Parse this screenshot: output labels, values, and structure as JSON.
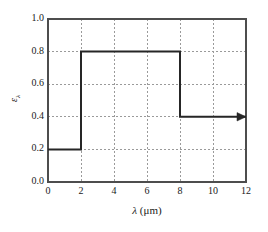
{
  "chart_data": {
    "type": "line",
    "title": "",
    "subtitle": "",
    "xlabel_symbol": "λ",
    "xlabel_unit": "(μm)",
    "xlabel": "λ (μm)",
    "ylabel_symbol": "ε",
    "ylabel_subscript": "λ",
    "ylabel": "ελ",
    "xlim": [
      0,
      12
    ],
    "ylim": [
      0.0,
      1.0
    ],
    "xticks": [
      "0",
      "2",
      "4",
      "6",
      "8",
      "10",
      "12"
    ],
    "xtick_values": [
      0,
      2,
      4,
      6,
      8,
      10,
      12
    ],
    "yticks": [
      "0.0",
      "0.2",
      "0.4",
      "0.6",
      "0.8",
      "1.0"
    ],
    "ytick_values": [
      0.0,
      0.2,
      0.4,
      0.6,
      0.8,
      1.0
    ],
    "grid": true,
    "grid_style": "dotted",
    "legend": null,
    "legend_position": "none",
    "series": [
      {
        "name": "ελ",
        "style": "step",
        "x": [
          0,
          2,
          2,
          8,
          8,
          12
        ],
        "y": [
          0.2,
          0.2,
          0.8,
          0.8,
          0.4,
          0.4
        ],
        "segments": [
          {
            "x_start": 0,
            "x_end": 2,
            "value": 0.2
          },
          {
            "x_start": 2,
            "x_end": 8,
            "value": 0.8
          },
          {
            "x_start": 8,
            "x_end": 12,
            "value": 0.4
          }
        ],
        "end_arrow": true,
        "end_arrow_note": "arrow at right end indicating value continues beyond 12 μm"
      }
    ],
    "colors": {
      "curve": "#262626",
      "frame": "#4d4d4d",
      "grid": "#9a9a9a",
      "background": "#ffffff",
      "text": "#1a1a1a"
    }
  }
}
